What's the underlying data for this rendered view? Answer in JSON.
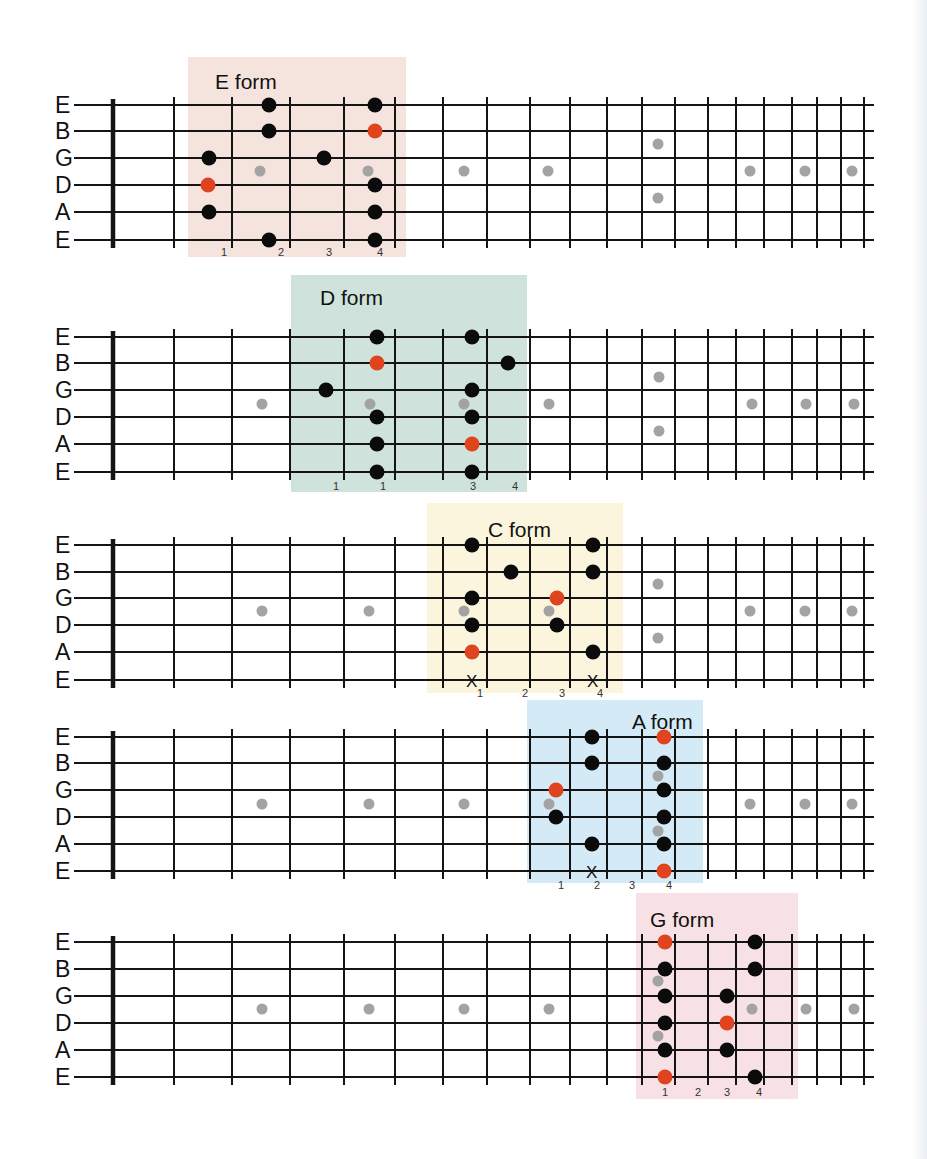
{
  "page": {
    "background": "#ffffff"
  },
  "colors": {
    "root_note": "#e0441f",
    "scale_note": "#0b0b0b",
    "fret_marker": "#a3a3a3",
    "line": "#141414"
  },
  "fretboard": {
    "string_names": [
      "E",
      "B",
      "G",
      "D",
      "A",
      "E"
    ],
    "nut_x": 113,
    "fret_x": [
      174,
      232,
      290,
      344,
      395,
      443,
      487,
      530,
      570,
      607,
      642,
      675,
      708,
      736,
      764,
      792,
      817,
      841,
      864
    ],
    "string_end_x": 874,
    "inlay_x": [
      262,
      369,
      464,
      549,
      658,
      750,
      805,
      852
    ],
    "inlay_double_x": 658
  },
  "diagrams": [
    {
      "id": "e-form",
      "title": "E form",
      "box": {
        "x": 188,
        "y": 57,
        "w": 218,
        "h": 200,
        "color": "#f5e4de"
      },
      "title_pos": {
        "x": 215,
        "y": 82
      },
      "string_y": [
        105,
        131,
        158,
        185,
        212,
        240
      ],
      "inlay_y_center": 171,
      "inlay_double_y": [
        144,
        198
      ],
      "inlays_shown": [
        "262",
        "369",
        "464",
        "549",
        "658",
        "750",
        "805",
        "852"
      ],
      "notes": [
        {
          "x": 269,
          "s": 0,
          "type": "scale"
        },
        {
          "x": 375,
          "s": 0,
          "type": "scale"
        },
        {
          "x": 269,
          "s": 1,
          "type": "scale"
        },
        {
          "x": 375,
          "s": 1,
          "type": "root"
        },
        {
          "x": 209,
          "s": 2,
          "type": "scale"
        },
        {
          "x": 324,
          "s": 2,
          "type": "scale"
        },
        {
          "x": 208,
          "s": 3,
          "type": "root"
        },
        {
          "x": 375,
          "s": 3,
          "type": "scale"
        },
        {
          "x": 209,
          "s": 4,
          "type": "scale"
        },
        {
          "x": 375,
          "s": 4,
          "type": "scale"
        },
        {
          "x": 269,
          "s": 5,
          "type": "scale"
        },
        {
          "x": 375,
          "s": 5,
          "type": "scale"
        }
      ],
      "inlays": [
        {
          "x": 260,
          "y": 171
        },
        {
          "x": 368,
          "y": 171
        },
        {
          "x": 464,
          "y": 171
        },
        {
          "x": 548,
          "y": 171
        },
        {
          "x": 658,
          "y": 144
        },
        {
          "x": 658,
          "y": 198
        },
        {
          "x": 750,
          "y": 171
        },
        {
          "x": 805,
          "y": 171
        },
        {
          "x": 852,
          "y": 171
        }
      ],
      "mutes": [],
      "fingers": [
        {
          "x": 224,
          "label": "1"
        },
        {
          "x": 281,
          "label": "2"
        },
        {
          "x": 329,
          "label": "3"
        },
        {
          "x": 380,
          "label": "4"
        }
      ],
      "finger_y": 256
    },
    {
      "id": "d-form",
      "title": "D form",
      "box": {
        "x": 291,
        "y": 275,
        "w": 236,
        "h": 217,
        "color": "#cfe3dc"
      },
      "title_pos": {
        "x": 320,
        "y": 298
      },
      "string_y": [
        337,
        363,
        390,
        417,
        444,
        472
      ],
      "notes": [
        {
          "x": 377,
          "s": 0,
          "type": "scale"
        },
        {
          "x": 472,
          "s": 0,
          "type": "scale"
        },
        {
          "x": 377,
          "s": 1,
          "type": "root"
        },
        {
          "x": 508,
          "s": 1,
          "type": "scale"
        },
        {
          "x": 326,
          "s": 2,
          "type": "scale"
        },
        {
          "x": 472,
          "s": 2,
          "type": "scale"
        },
        {
          "x": 377,
          "s": 3,
          "type": "scale"
        },
        {
          "x": 472,
          "s": 3,
          "type": "scale"
        },
        {
          "x": 377,
          "s": 4,
          "type": "scale"
        },
        {
          "x": 472,
          "s": 4,
          "type": "root"
        },
        {
          "x": 377,
          "s": 5,
          "type": "scale"
        },
        {
          "x": 472,
          "s": 5,
          "type": "scale"
        }
      ],
      "inlays": [
        {
          "x": 262,
          "y": 404
        },
        {
          "x": 370,
          "y": 404
        },
        {
          "x": 464,
          "y": 404
        },
        {
          "x": 549,
          "y": 404
        },
        {
          "x": 659,
          "y": 377
        },
        {
          "x": 659,
          "y": 431
        },
        {
          "x": 752,
          "y": 404
        },
        {
          "x": 806,
          "y": 404
        },
        {
          "x": 854,
          "y": 404
        }
      ],
      "mutes": [],
      "fingers": [
        {
          "x": 336,
          "label": "1"
        },
        {
          "x": 383,
          "label": "1"
        },
        {
          "x": 473,
          "label": "3"
        },
        {
          "x": 515,
          "label": "4"
        }
      ],
      "finger_y": 490
    },
    {
      "id": "c-form",
      "title": "C form",
      "box": {
        "x": 427,
        "y": 503,
        "w": 196,
        "h": 190,
        "color": "#faf5dc"
      },
      "title_pos": {
        "x": 488,
        "y": 530
      },
      "string_y": [
        545,
        572,
        598,
        625,
        652,
        680
      ],
      "notes": [
        {
          "x": 472,
          "s": 0,
          "type": "scale"
        },
        {
          "x": 593,
          "s": 0,
          "type": "scale"
        },
        {
          "x": 511,
          "s": 1,
          "type": "scale"
        },
        {
          "x": 593,
          "s": 1,
          "type": "scale"
        },
        {
          "x": 472,
          "s": 2,
          "type": "scale"
        },
        {
          "x": 557,
          "s": 2,
          "type": "root"
        },
        {
          "x": 472,
          "s": 3,
          "type": "scale"
        },
        {
          "x": 557,
          "s": 3,
          "type": "scale"
        },
        {
          "x": 472,
          "s": 4,
          "type": "root"
        },
        {
          "x": 593,
          "s": 4,
          "type": "scale"
        }
      ],
      "inlays": [
        {
          "x": 262,
          "y": 611
        },
        {
          "x": 369,
          "y": 611
        },
        {
          "x": 464,
          "y": 611
        },
        {
          "x": 549,
          "y": 611
        },
        {
          "x": 658,
          "y": 584
        },
        {
          "x": 658,
          "y": 638
        },
        {
          "x": 750,
          "y": 611
        },
        {
          "x": 805,
          "y": 611
        },
        {
          "x": 852,
          "y": 611
        }
      ],
      "mutes": [
        {
          "x": 472,
          "label": "X"
        },
        {
          "x": 593,
          "label": "X"
        }
      ],
      "fingers": [
        {
          "x": 480,
          "label": "1"
        },
        {
          "x": 525,
          "label": "2"
        },
        {
          "x": 562,
          "label": "3"
        },
        {
          "x": 600,
          "label": "4"
        }
      ],
      "finger_y": 697
    },
    {
      "id": "a-form",
      "title": "A form",
      "box": {
        "x": 527,
        "y": 700,
        "w": 176,
        "h": 183,
        "color": "#d4eaf6"
      },
      "title_pos": {
        "x": 632,
        "y": 722
      },
      "string_y": [
        737,
        763,
        790,
        817,
        844,
        871
      ],
      "notes": [
        {
          "x": 592,
          "s": 0,
          "type": "scale"
        },
        {
          "x": 664,
          "s": 0,
          "type": "root"
        },
        {
          "x": 592,
          "s": 1,
          "type": "scale"
        },
        {
          "x": 664,
          "s": 1,
          "type": "scale"
        },
        {
          "x": 556,
          "s": 2,
          "type": "root"
        },
        {
          "x": 664,
          "s": 2,
          "type": "scale"
        },
        {
          "x": 556,
          "s": 3,
          "type": "scale"
        },
        {
          "x": 664,
          "s": 3,
          "type": "scale"
        },
        {
          "x": 592,
          "s": 4,
          "type": "scale"
        },
        {
          "x": 664,
          "s": 4,
          "type": "scale"
        },
        {
          "x": 664,
          "s": 5,
          "type": "root"
        }
      ],
      "inlays": [
        {
          "x": 262,
          "y": 804
        },
        {
          "x": 369,
          "y": 804
        },
        {
          "x": 464,
          "y": 804
        },
        {
          "x": 549,
          "y": 804
        },
        {
          "x": 658,
          "y": 776
        },
        {
          "x": 658,
          "y": 831
        },
        {
          "x": 750,
          "y": 804
        },
        {
          "x": 805,
          "y": 804
        },
        {
          "x": 852,
          "y": 804
        }
      ],
      "mutes": [
        {
          "x": 592,
          "label": "X"
        }
      ],
      "fingers": [
        {
          "x": 561,
          "label": "1"
        },
        {
          "x": 597,
          "label": "2"
        },
        {
          "x": 632,
          "label": "3"
        },
        {
          "x": 669,
          "label": "4"
        }
      ],
      "finger_y": 889
    },
    {
      "id": "g-form",
      "title": "G form",
      "box": {
        "x": 636,
        "y": 893,
        "w": 162,
        "h": 206,
        "color": "#f7e1e4"
      },
      "title_pos": {
        "x": 650,
        "y": 920
      },
      "string_y": [
        942,
        969,
        996,
        1023,
        1050,
        1077
      ],
      "notes": [
        {
          "x": 665,
          "s": 0,
          "type": "root"
        },
        {
          "x": 755,
          "s": 0,
          "type": "scale"
        },
        {
          "x": 665,
          "s": 1,
          "type": "scale"
        },
        {
          "x": 755,
          "s": 1,
          "type": "scale"
        },
        {
          "x": 665,
          "s": 2,
          "type": "scale"
        },
        {
          "x": 727,
          "s": 2,
          "type": "scale"
        },
        {
          "x": 665,
          "s": 3,
          "type": "scale"
        },
        {
          "x": 727,
          "s": 3,
          "type": "root"
        },
        {
          "x": 665,
          "s": 4,
          "type": "scale"
        },
        {
          "x": 727,
          "s": 4,
          "type": "scale"
        },
        {
          "x": 665,
          "s": 5,
          "type": "root"
        },
        {
          "x": 755,
          "s": 5,
          "type": "scale"
        }
      ],
      "inlays": [
        {
          "x": 262,
          "y": 1009
        },
        {
          "x": 369,
          "y": 1009
        },
        {
          "x": 464,
          "y": 1009
        },
        {
          "x": 549,
          "y": 1009
        },
        {
          "x": 658,
          "y": 981
        },
        {
          "x": 658,
          "y": 1036
        },
        {
          "x": 752,
          "y": 1009
        },
        {
          "x": 806,
          "y": 1009
        },
        {
          "x": 854,
          "y": 1009
        }
      ],
      "mutes": [],
      "fingers": [
        {
          "x": 665,
          "label": "1"
        },
        {
          "x": 698,
          "label": "2"
        },
        {
          "x": 727,
          "label": "3"
        },
        {
          "x": 759,
          "label": "4"
        }
      ],
      "finger_y": 1096
    }
  ]
}
